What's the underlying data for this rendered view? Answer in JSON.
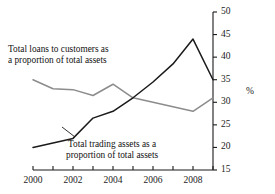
{
  "chart_data": {
    "type": "line",
    "title": "",
    "xlabel": "",
    "ylabel": "%",
    "x": [
      2000,
      2001,
      2002,
      2003,
      2004,
      2005,
      2006,
      2007,
      2008,
      2009
    ],
    "xlim": [
      2000,
      2009
    ],
    "ylim": [
      15,
      50
    ],
    "yticks": [
      15,
      20,
      25,
      30,
      35,
      40,
      45,
      50
    ],
    "xticks": [
      2000,
      2001,
      2002,
      2003,
      2004,
      2005,
      2006,
      2007,
      2008,
      2009
    ],
    "xtick_labels": [
      "2000",
      "",
      "2002",
      "",
      "2004",
      "",
      "2006",
      "",
      "2008",
      ""
    ],
    "ytick_labels": [
      "15",
      "20",
      "25",
      "30",
      "35",
      "40",
      "45",
      "50"
    ],
    "grid": false,
    "legend": "inline-annotations",
    "axis_position": "right",
    "series": [
      {
        "name": "Total loans to customers as a proportion of total assets",
        "color": "#8c8c8c",
        "values": [
          35.0,
          33.0,
          32.8,
          31.5,
          34.0,
          31.0,
          30.0,
          29.0,
          28.0,
          31.0
        ]
      },
      {
        "name": "Total trading assets as a proportion of total assets",
        "color": "#1a1a1a",
        "values": [
          20.0,
          21.0,
          22.0,
          26.5,
          28.0,
          31.0,
          34.5,
          38.5,
          44.0,
          35.0
        ]
      }
    ],
    "annotations": [
      {
        "id": "loans",
        "line1": "Total loans to customers as",
        "line2": "a proportion of total assets"
      },
      {
        "id": "trading",
        "line1": "Total trading assets as a",
        "line2": "proportion of total assets"
      }
    ]
  },
  "axis": {
    "unit_label": "%"
  }
}
